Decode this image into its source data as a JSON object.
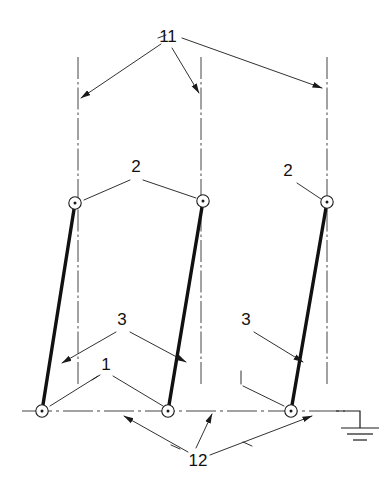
{
  "diagram": {
    "type": "mechanical-kinematic-schematic",
    "background_color": "#ffffff",
    "line_color": "#1a1a1a",
    "thick_link_color": "#111111",
    "centerline_color": "#303030",
    "labels": [
      {
        "id": "label-11",
        "text": "11",
        "x": 168,
        "y": 42
      },
      {
        "id": "label-2-left",
        "text": "2",
        "x": 136,
        "y": 172
      },
      {
        "id": "label-2-right",
        "text": "2",
        "x": 288,
        "y": 176
      },
      {
        "id": "label-3-left",
        "text": "3",
        "x": 120,
        "y": 325
      },
      {
        "id": "label-3-right",
        "text": "3",
        "x": 245,
        "y": 325
      },
      {
        "id": "label-1",
        "text": "1",
        "x": 106,
        "y": 367
      },
      {
        "id": "label-12",
        "text": "12",
        "x": 196,
        "y": 463
      }
    ],
    "joints": [
      {
        "id": "joint-upper-left",
        "x": 75,
        "y": 203,
        "r": 6.2
      },
      {
        "id": "joint-upper-middle",
        "x": 203,
        "y": 201,
        "r": 6.2
      },
      {
        "id": "joint-upper-right",
        "x": 327,
        "y": 202,
        "r": 6.2
      },
      {
        "id": "joint-lower-left",
        "x": 42,
        "y": 411,
        "r": 6.2
      },
      {
        "id": "joint-lower-middle",
        "x": 168,
        "y": 411,
        "r": 6.2
      },
      {
        "id": "joint-lower-right",
        "x": 291,
        "y": 411,
        "r": 6.2
      }
    ],
    "links": [
      {
        "id": "link-left",
        "x1": 75,
        "y1": 203,
        "x2": 42,
        "y2": 411
      },
      {
        "id": "link-middle",
        "x1": 203,
        "y1": 201,
        "x2": 168,
        "y2": 411
      },
      {
        "id": "link-right",
        "x1": 327,
        "y1": 202,
        "x2": 291,
        "y2": 411
      }
    ],
    "centerlines": [
      {
        "id": "centerline-left",
        "x": 78,
        "y1": 57,
        "y2": 385
      },
      {
        "id": "centerline-middle",
        "x": 201,
        "y1": 57,
        "y2": 385
      },
      {
        "id": "centerline-right",
        "x": 327,
        "y1": 57,
        "y2": 385
      }
    ],
    "axis": {
      "id": "axis-horizontal",
      "x1": 22,
      "y": 411,
      "x2": 345
    },
    "ground_symbol": {
      "id": "ground-earth-symbol",
      "lead_x1": 340,
      "lead_y": 411,
      "lead_x2": 360,
      "stem_x": 360,
      "stem_y1": 411,
      "stem_y2": 428,
      "bars": [
        {
          "x1": 341,
          "x2": 379,
          "y": 428
        },
        {
          "x1": 347,
          "x2": 373,
          "y": 434
        },
        {
          "x1": 353,
          "x2": 367,
          "y": 440
        }
      ]
    },
    "arrow_size": {
      "length": 9,
      "width": 3.2
    }
  }
}
